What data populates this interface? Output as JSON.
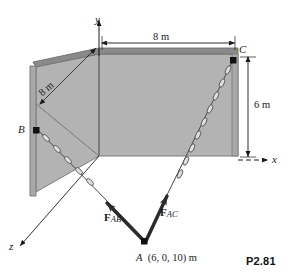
{
  "figure": {
    "number": "P2.81",
    "type": "statics-free-body-diagram",
    "background_color": "#ffffff",
    "panel_fill_color": "#b3b3b3",
    "panel_edge_color": "#808080",
    "line_color": "#1a1a1a"
  },
  "axes": {
    "y": {
      "label": "y",
      "direction": "up"
    },
    "x": {
      "label": "x",
      "direction": "right"
    },
    "z": {
      "label": "z",
      "direction": "down-left"
    }
  },
  "points": [
    {
      "name": "B",
      "label": "B",
      "marker": "filled-square"
    },
    {
      "name": "C",
      "label": "C",
      "marker": "filled-square"
    },
    {
      "name": "A",
      "label": "A",
      "marker": "filled-square",
      "coordinates": "(6, 0, 10) m"
    }
  ],
  "dimensions": [
    {
      "name": "top-width",
      "label": "8 m",
      "orientation": "horizontal",
      "from": "origin",
      "to": "C"
    },
    {
      "name": "oblique-width",
      "label": "8 m",
      "orientation": "oblique",
      "from": "origin",
      "to": "B"
    },
    {
      "name": "height",
      "label": "6 m",
      "orientation": "vertical",
      "from": "C",
      "to": "x-axis"
    }
  ],
  "forces": [
    {
      "name": "F_AB",
      "symbol": "F",
      "subscript": "AB",
      "from": "A",
      "to": "B",
      "style": "bold-arrow"
    },
    {
      "name": "F_AC",
      "symbol": "F",
      "subscript": "AC",
      "from": "A",
      "to": "C",
      "style": "bold-arrow"
    }
  ],
  "cables": [
    {
      "name": "cable-AB",
      "from": "A",
      "to": "B",
      "style": "chain"
    },
    {
      "name": "cable-AC",
      "from": "A",
      "to": "C",
      "style": "chain"
    }
  ],
  "labels": {
    "y_axis": "y",
    "x_axis": "x",
    "z_axis": "z",
    "point_b": "B",
    "point_c": "C",
    "point_a": "A",
    "point_a_coords": "(6, 0, 10) m",
    "dim_top": "8 m",
    "dim_oblique": "8 m",
    "dim_height": "6 m",
    "force_ab_symbol": "F",
    "force_ab_sub": "AB",
    "force_ac_symbol": "F",
    "force_ac_sub": "AC",
    "figure_number": "P2.81"
  }
}
